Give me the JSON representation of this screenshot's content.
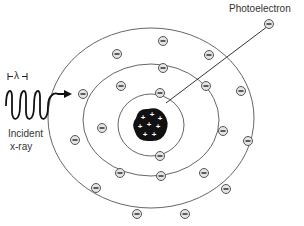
{
  "labels": {
    "photoelectron": "Photoelectron",
    "incident_line1": "Incident",
    "incident_line2": "x-ray",
    "wavelength": "λ"
  },
  "nucleus": {
    "center": [
      151,
      125
    ],
    "radius": 17,
    "charge_symbol": "+",
    "color": "#111111"
  },
  "shells": [
    {
      "name": "K",
      "center": [
        151,
        125
      ],
      "rx": 33,
      "ry": 31,
      "electrons": 2
    },
    {
      "name": "L",
      "center": [
        151,
        125
      ],
      "rx": 68,
      "ry": 59,
      "electrons": 8
    },
    {
      "name": "M",
      "center": [
        151,
        125
      ],
      "rx": 103,
      "ry": 90,
      "electrons": 9
    }
  ],
  "electron_symbol": "−",
  "colors": {
    "line": "#555555",
    "electron_fill": "#dddddd",
    "text": "#333333"
  }
}
